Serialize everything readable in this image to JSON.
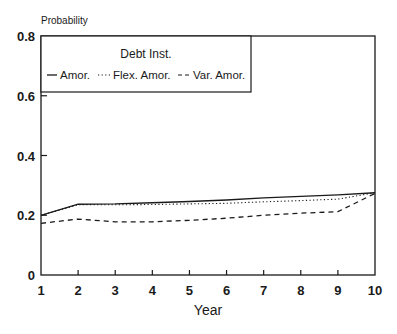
{
  "chart_data": {
    "type": "line",
    "title": "",
    "xlabel": "Year",
    "ylabel": "Probability",
    "x": [
      1,
      2,
      3,
      4,
      5,
      6,
      7,
      8,
      9,
      10
    ],
    "xticks": [
      "1",
      "2",
      "3",
      "4",
      "5",
      "6",
      "7",
      "8",
      "9",
      "10"
    ],
    "yticks": [
      "0",
      "0.2",
      "0.4",
      "0.6",
      "0.8"
    ],
    "ytick_values": [
      0,
      0.2,
      0.4,
      0.6,
      0.8
    ],
    "xlim": [
      1,
      10
    ],
    "ylim": [
      0,
      0.8
    ],
    "grid": false,
    "legend": {
      "title": "Debt Inst.",
      "position": "upper-left",
      "entries": [
        "Amor.",
        "Flex. Amor.",
        "Var. Amor."
      ]
    },
    "series": [
      {
        "name": "Amor.",
        "style": "solid",
        "values": [
          0.2,
          0.237,
          0.238,
          0.242,
          0.246,
          0.251,
          0.258,
          0.263,
          0.268,
          0.275
        ]
      },
      {
        "name": "Flex. Amor.",
        "style": "dotted",
        "values": [
          0.2,
          0.235,
          0.235,
          0.236,
          0.238,
          0.24,
          0.245,
          0.249,
          0.254,
          0.275
        ]
      },
      {
        "name": "Var. Amor.",
        "style": "dashed",
        "values": [
          0.173,
          0.187,
          0.178,
          0.178,
          0.183,
          0.19,
          0.2,
          0.207,
          0.212,
          0.273
        ]
      }
    ]
  },
  "colors": {
    "ink": "#1a1a1a",
    "background": "#ffffff"
  }
}
